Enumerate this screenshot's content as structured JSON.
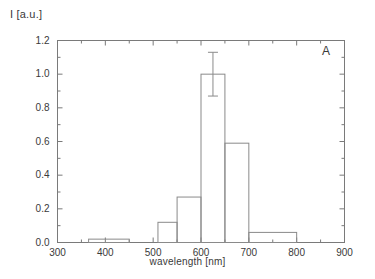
{
  "chart_data": {
    "type": "bar",
    "title": "",
    "panel_label": "A",
    "xlabel": "wavelength [nm]",
    "ylabel": "I [a.u.]",
    "xlim": [
      300,
      900
    ],
    "ylim": [
      0.0,
      1.2
    ],
    "grid": false,
    "legend": null,
    "style": "open outlined histogram bars, boxed frame, ticks inward",
    "xticks": [
      300,
      400,
      500,
      600,
      700,
      800,
      900
    ],
    "xtick_labels": [
      "300",
      "400",
      "500",
      "600",
      "700",
      "800",
      "900"
    ],
    "xminor_step": 50,
    "yticks": [
      0.0,
      0.2,
      0.4,
      0.6,
      0.8,
      1.0,
      1.2
    ],
    "ytick_labels": [
      "0.0",
      "0.2",
      "0.4",
      "0.6",
      "0.8",
      "1.0",
      "1.2"
    ],
    "yminor_step": 0.1,
    "bins": [
      {
        "x0": 365,
        "x1": 450,
        "value": 0.02
      },
      {
        "x0": 510,
        "x1": 550,
        "value": 0.12
      },
      {
        "x0": 550,
        "x1": 600,
        "value": 0.27
      },
      {
        "x0": 600,
        "x1": 650,
        "value": 1.0
      },
      {
        "x0": 650,
        "x1": 700,
        "value": 0.59
      },
      {
        "x0": 700,
        "x1": 800,
        "value": 0.06
      }
    ],
    "categories": [
      "365-450",
      "510-550",
      "550-600",
      "600-650",
      "650-700",
      "700-800"
    ],
    "values": [
      0.02,
      0.12,
      0.27,
      1.0,
      0.59,
      0.06
    ],
    "error_bars": [
      {
        "x": 625,
        "value": 1.0,
        "lower": 0.87,
        "upper": 1.13,
        "err": 0.13
      }
    ]
  },
  "colors": {
    "axis": "#7a7a7a",
    "bar_stroke": "#8a8a8a",
    "text": "#3a3a3a",
    "background": "#ffffff"
  }
}
